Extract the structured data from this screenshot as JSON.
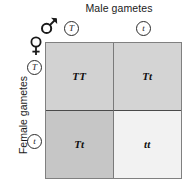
{
  "diagram": {
    "type": "punnett-square",
    "top_axis": {
      "title": "Male gametes",
      "symbol": "mars-symbol",
      "gametes": [
        "T",
        "t"
      ]
    },
    "left_axis": {
      "title": "Female gametes",
      "symbol": "venus-symbol",
      "gametes": [
        "T",
        "t"
      ]
    },
    "cells": [
      {
        "id": "cell-TT",
        "genotype": "TT",
        "row": "T",
        "column": "T",
        "shade": "#d2d2d2"
      },
      {
        "id": "cell-Tt-top",
        "genotype": "Tt",
        "row": "T",
        "column": "t",
        "shade": "#d4d4d4"
      },
      {
        "id": "cell-Tt-bottom",
        "genotype": "Tt",
        "row": "t",
        "column": "T",
        "shade": "#c6c6c6"
      },
      {
        "id": "cell-tt",
        "genotype": "tt",
        "row": "t",
        "column": "t",
        "shade": "#f2f2f2"
      }
    ],
    "colors": {
      "grid_border": "#808080",
      "inner_line": "#4a4a4a",
      "text": "#1a1a1a"
    }
  }
}
